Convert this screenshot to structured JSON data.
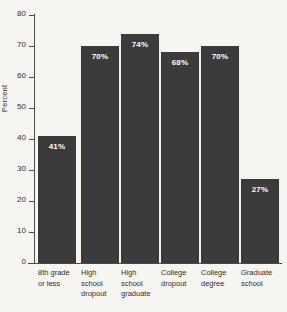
{
  "chart_data": {
    "type": "bar",
    "title": "",
    "xlabel": "",
    "ylabel": "Percent",
    "ylim": [
      0,
      80
    ],
    "grid": false,
    "legend": "none",
    "yticks": [
      80,
      70,
      60,
      50,
      40,
      30,
      20,
      10,
      0
    ],
    "ytick_labels": [
      "80",
      "70",
      "60",
      "50",
      "40",
      "30",
      "20",
      "10",
      "0"
    ],
    "categories": [
      "8th grade\nor less",
      "High\nschool\ndropout",
      "High\nschool\ngraduate",
      "College\ndropout",
      "College\ndegree",
      "Graduate\nschool"
    ],
    "values": [
      41,
      70,
      74,
      68,
      70,
      27
    ],
    "value_labels": [
      "41%",
      "70%",
      "74%",
      "68%",
      "70%",
      "27%"
    ],
    "colors": {
      "bar": "#3b3b3b",
      "background": "#f6f5f2",
      "axis": "#4a4a48",
      "text": "#2f2f2e",
      "value_label": "#ffffff"
    }
  }
}
